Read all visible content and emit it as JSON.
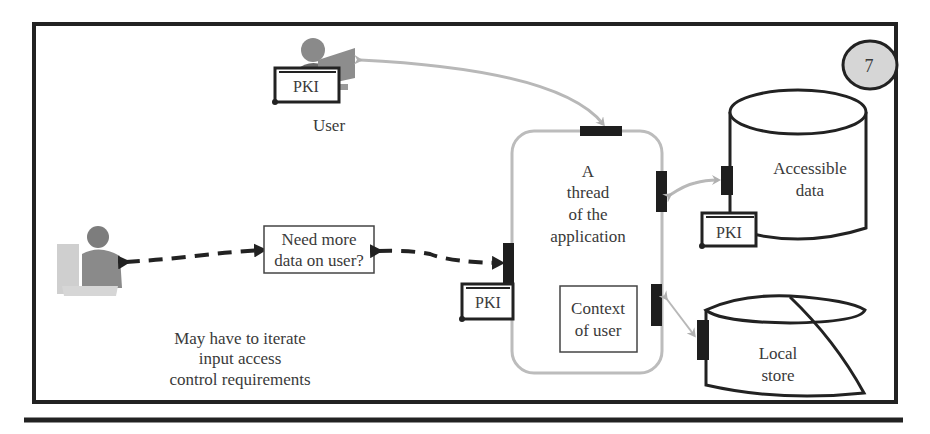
{
  "figure": {
    "step_number": "7",
    "colors": {
      "frame": "#222222",
      "connector_gray": "#b5b5b5",
      "port": "#1e1e1e",
      "step_badge_fill": "#d6d6d6",
      "dashed_arrow": "#222222"
    }
  },
  "actors": {
    "user": {
      "label": "User",
      "icon": "user-at-computer-icon",
      "credential": "PKI"
    },
    "admin": {
      "icon": "person-at-desk-icon"
    }
  },
  "prompt_box": {
    "line1": "Need more",
    "line2": "data on user?"
  },
  "iterate_note": {
    "line1": "May have to iterate",
    "line2": "input access",
    "line3": "control requirements"
  },
  "thread": {
    "line1": "A",
    "line2": "thread",
    "line3": "of the",
    "line4": "application",
    "credential": "PKI",
    "context_box": {
      "line1": "Context",
      "line2": "of user"
    }
  },
  "stores": {
    "accessible": {
      "line1": "Accessible",
      "line2": "data",
      "credential": "PKI"
    },
    "local": {
      "line1": "Local",
      "line2": "store"
    }
  }
}
